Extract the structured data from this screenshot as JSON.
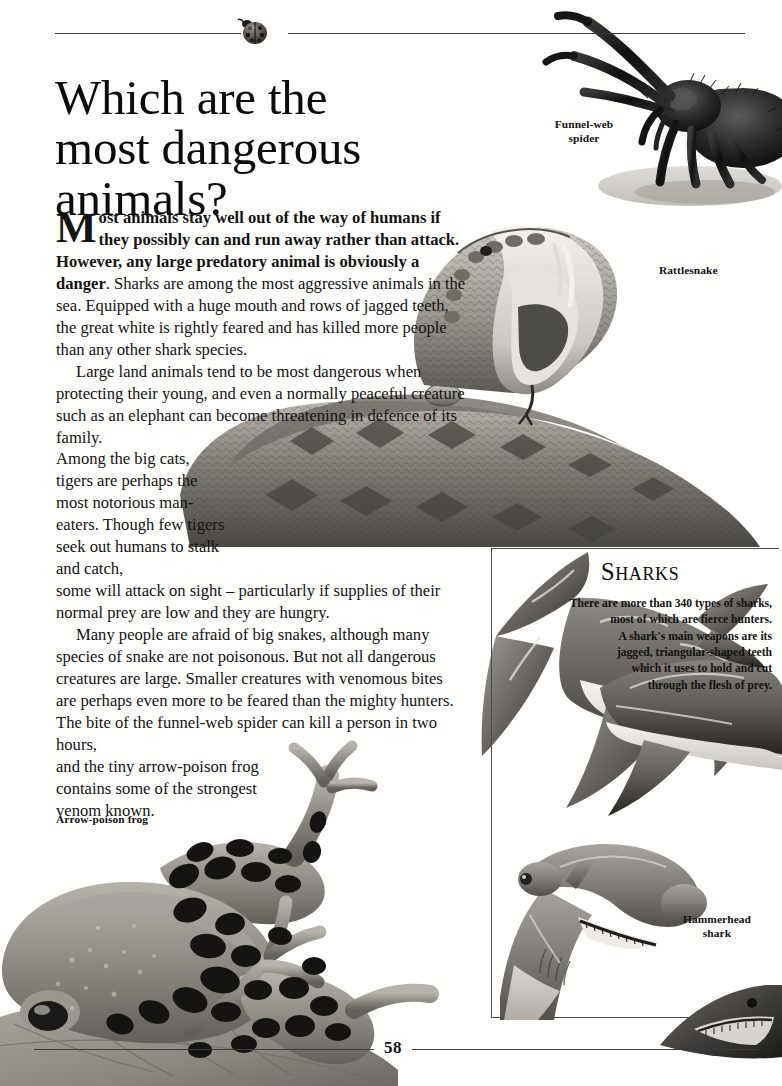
{
  "page": {
    "folio": "58",
    "decor_icon": "ladybird-icon"
  },
  "title": {
    "line1": "Which are the",
    "line2": "most dangerous",
    "line3": "animals?"
  },
  "body": {
    "dropcap": "M",
    "p1_bold_a": "ost animals stay well out of the way of humans if they possibly can and run away rather than attack. However, any large predatory animal is obviously a danger",
    "p1_rest": ". Sharks are among the most aggressive animals in the sea. Equipped with a huge mouth and rows of jagged teeth, the great white is rightly feared and has killed more people than any other shark species.",
    "p2_a": "Large land animals tend to be most dangerous when protecting their young, and even a normally peaceful creature such as an elephant can become threatening in defence of its family.",
    "p2_narrow": "Among the big cats, tigers are perhaps the most notorious man-eaters. Though few tigers seek out humans to stalk and catch,",
    "p2_b": "some will attack on sight – particularly if supplies of their normal prey are low and they are hungry.",
    "p3_a": "Many people are afraid of big snakes, although many species of snake are not poisonous. But not all dangerous creatures are large. Smaller creatures with venomous bites are perhaps even more to be feared than the mighty hunters. The bite of the funnel-web spider can kill a person in two hours,",
    "p3_narrow": "and the tiny arrow-poison frog contains some of the strongest venom known."
  },
  "captions": {
    "spider": "Funnel-web\nspider",
    "spider_l1": "Funnel-web",
    "spider_l2": "spider",
    "rattlesnake": "Rattlesnake",
    "frog": "Arrow-poison frog",
    "hammerhead_l1": "Hammerhead",
    "hammerhead_l2": "shark"
  },
  "sharks_panel": {
    "title_cap": "S",
    "title_rest": "HARKS",
    "lines": [
      "There are more than 340 types of sharks,",
      "most of which are fierce hunters.",
      "A shark's main weapons are its",
      "jagged, triangular-shaped teeth",
      "which it uses to hold and cut",
      "through the flesh of prey."
    ]
  },
  "illustrations": [
    {
      "name": "funnel-web-spider-illustration",
      "alt": "Funnel-web spider photograph"
    },
    {
      "name": "rattlesnake-illustration",
      "alt": "Coiled rattlesnake with open mouth"
    },
    {
      "name": "arrow-poison-frog-illustration",
      "alt": "Arrow-poison frog on leaf"
    },
    {
      "name": "great-white-shark-illustration",
      "alt": "Shark seen from below"
    },
    {
      "name": "hammerhead-shark-illustration",
      "alt": "Hammerhead shark"
    },
    {
      "name": "shark-snout-illustration",
      "alt": "Shark snout lower right"
    }
  ],
  "colors": {
    "ink": "#111111",
    "rule": "#3a3a3a",
    "panel_border": "#4a4a4a",
    "paper": "#ffffff"
  }
}
